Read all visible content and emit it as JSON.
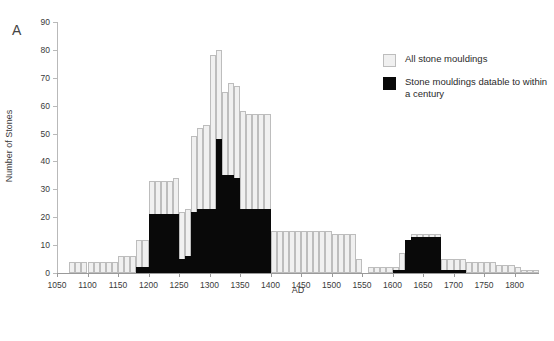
{
  "panel": {
    "label": "A"
  },
  "legend": {
    "items": [
      {
        "name": "all-stone-mouldings",
        "label": "All stone mouldings",
        "color": "#f0f0f0",
        "border": "#bdbdbd"
      },
      {
        "name": "stone-mouldings-datable",
        "label": "Stone mouldings datable to within a century",
        "color": "#090909",
        "border": "#090909"
      }
    ]
  },
  "chart_data": {
    "type": "bar",
    "title": "",
    "subtitle": "",
    "xlabel": "AD",
    "ylabel": "Number of Stones",
    "xlim": [
      1050,
      1840
    ],
    "ylim": [
      0,
      90
    ],
    "xticks": [
      1050,
      1100,
      1150,
      1200,
      1250,
      1300,
      1350,
      1400,
      1450,
      1500,
      1550,
      1600,
      1650,
      1700,
      1750,
      1800
    ],
    "yticks": [
      0,
      10,
      20,
      30,
      40,
      50,
      60,
      70,
      80,
      90
    ],
    "grid": false,
    "legend_position": "upper-right",
    "bin_width": 10,
    "bin_starts": [
      1050,
      1060,
      1070,
      1080,
      1090,
      1100,
      1110,
      1120,
      1130,
      1140,
      1150,
      1160,
      1170,
      1180,
      1190,
      1200,
      1210,
      1220,
      1230,
      1240,
      1250,
      1260,
      1270,
      1280,
      1290,
      1300,
      1310,
      1320,
      1330,
      1340,
      1350,
      1360,
      1370,
      1380,
      1390,
      1400,
      1410,
      1420,
      1430,
      1440,
      1450,
      1460,
      1470,
      1480,
      1490,
      1500,
      1510,
      1520,
      1530,
      1540,
      1550,
      1560,
      1570,
      1580,
      1590,
      1600,
      1610,
      1620,
      1630,
      1640,
      1650,
      1660,
      1670,
      1680,
      1690,
      1700,
      1710,
      1720,
      1730,
      1740,
      1750,
      1760,
      1770,
      1780,
      1790,
      1800,
      1810,
      1820,
      1830
    ],
    "series": [
      {
        "name": "All stone mouldings",
        "values": [
          0,
          0,
          4,
          4,
          4,
          4,
          4,
          4,
          4,
          4,
          6,
          6,
          6,
          12,
          12,
          33,
          33,
          33,
          33,
          34,
          22,
          23,
          49,
          52,
          53,
          78,
          80,
          65,
          68,
          67,
          58,
          57,
          57,
          57,
          57,
          15,
          15,
          15,
          15,
          15,
          15,
          15,
          15,
          15,
          15,
          14,
          14,
          14,
          14,
          5,
          0,
          2,
          2,
          2,
          2,
          2,
          7,
          12,
          14,
          14,
          14,
          14,
          14,
          5,
          5,
          5,
          5,
          4,
          4,
          4,
          4,
          4,
          3,
          3,
          3,
          2,
          1,
          1,
          1
        ]
      },
      {
        "name": "Stone mouldings datable to within a century",
        "values": [
          0,
          0,
          0,
          0,
          0,
          0,
          0,
          0,
          0,
          0,
          0,
          0,
          0,
          2,
          2,
          21,
          21,
          21,
          21,
          21,
          5,
          6,
          22,
          23,
          23,
          23,
          48,
          35,
          35,
          34,
          23,
          23,
          23,
          23,
          23,
          0,
          0,
          0,
          0,
          0,
          0,
          0,
          0,
          0,
          0,
          0,
          0,
          0,
          0,
          0,
          0,
          0,
          0,
          0,
          0,
          1,
          1,
          12,
          13,
          13,
          13,
          13,
          13,
          1,
          1,
          1,
          1,
          0,
          0,
          0,
          0,
          0,
          0,
          0,
          0,
          0,
          0,
          0,
          0
        ]
      }
    ]
  }
}
